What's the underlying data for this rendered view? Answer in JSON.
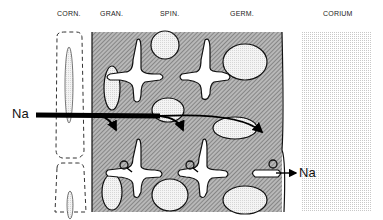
{
  "diagram": {
    "layers": [
      {
        "id": "corneum",
        "label": "CORN.",
        "x": 57
      },
      {
        "id": "granulosum",
        "label": "GRAN.",
        "x": 100
      },
      {
        "id": "spinosum",
        "label": "SPIN.",
        "x": 160
      },
      {
        "id": "germinativum",
        "label": "GERM.",
        "x": 230
      },
      {
        "id": "corium",
        "label": "CORIUM",
        "x": 323
      }
    ],
    "ion_in": "Na",
    "ion_out": "Na",
    "colors": {
      "hatch": "#7a7a7a",
      "cell_fill": "#e6e6e6",
      "arrow": "#000000",
      "corium_dots": "#c8c8c8"
    }
  }
}
